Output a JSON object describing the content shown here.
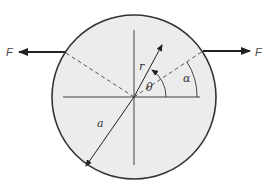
{
  "diagram": {
    "colors": {
      "disk_fill": "#ececec",
      "stroke": "#333333",
      "dashed": "#555555",
      "background": "#ffffff"
    },
    "circle": {
      "cx": 134,
      "cy": 97,
      "r": 82
    },
    "labels": {
      "force_left": "F",
      "force_right": "F",
      "radius_vector": "r",
      "polar_angle": "θ",
      "load_angle": "α",
      "disk_radius": "a"
    },
    "elements": [
      "disk",
      "horizontal-axis",
      "vertical-axis",
      "dashed-loading-line",
      "left-force-arrow",
      "right-force-arrow",
      "radius-vector-r",
      "theta-arc",
      "alpha-arc",
      "disk-radius-arrow-a"
    ]
  }
}
